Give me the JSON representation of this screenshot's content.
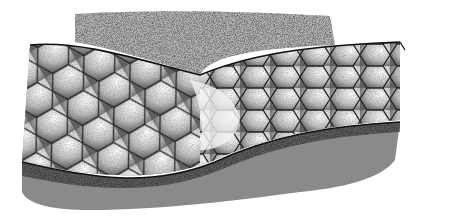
{
  "image": {
    "subject": "Stippled pen-and-ink illustration of snake skin scales",
    "colors": {
      "background": "#ffffff",
      "shadow": "#8a8a8a",
      "shadow_dark": "#3a3a3a",
      "scale_fill": "#f2f2f2",
      "scale_stipple": "#6e6e6e",
      "outline": "#1a1a1a"
    }
  }
}
